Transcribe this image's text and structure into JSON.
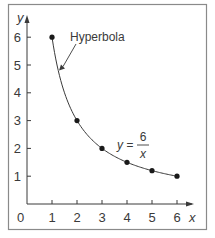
{
  "chart_data": {
    "type": "scatter",
    "title": "",
    "xlabel": "x",
    "ylabel": "y",
    "xlim": [
      0,
      6
    ],
    "ylim": [
      0,
      6
    ],
    "x_ticks": [
      1,
      2,
      3,
      4,
      5,
      6
    ],
    "y_ticks": [
      1,
      2,
      3,
      4,
      5,
      6
    ],
    "origin_label": "0",
    "grid": false,
    "series": [
      {
        "name": "y = 6/x",
        "x": [
          1,
          2,
          3,
          4,
          5,
          6
        ],
        "y": [
          6,
          3,
          2,
          1.5,
          1.2,
          1
        ],
        "style": "markers connected by smooth curve"
      }
    ],
    "annotations": [
      {
        "text": "Hyperbola",
        "arrow_to": [
          1.2,
          4.8
        ]
      },
      {
        "text": "y = 6/x",
        "equation": {
          "lhs": "y =",
          "numerator": "6",
          "denominator": "x"
        }
      }
    ]
  },
  "colors": {
    "frame": "#8a8a8a",
    "axis": "#3a3a3a",
    "curve": "#3a3a3a",
    "marker": "#1a1a1a",
    "text": "#3a3a3a"
  }
}
